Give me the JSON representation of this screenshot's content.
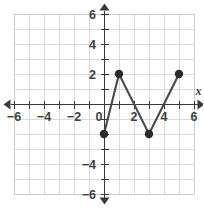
{
  "chart_data": {
    "type": "line",
    "title": "",
    "subtitle": "",
    "xlabel": "x",
    "ylabel": "",
    "xlim": [
      -6.6,
      6.6
    ],
    "ylim": [
      -6.6,
      6.6
    ],
    "grid": true,
    "grid_step": 1,
    "legend": "none",
    "x_tick_labels": [
      "-6",
      "-4",
      "-2",
      "0",
      "2",
      "4",
      "6"
    ],
    "x_tick_values": [
      -6,
      -4,
      -2,
      0,
      2,
      4,
      6
    ],
    "y_tick_labels": [
      "6",
      "4",
      "2",
      "-4",
      "-6"
    ],
    "y_tick_values": [
      6,
      4,
      2,
      -4,
      -6
    ],
    "origin_label": "0",
    "series": [
      {
        "name": "zigzag",
        "x": [
          0,
          1,
          3,
          5
        ],
        "y": [
          -2,
          2,
          -2,
          2
        ],
        "points": [
          {
            "x": 0,
            "y": -2
          },
          {
            "x": 1,
            "y": 2
          },
          {
            "x": 3,
            "y": -2
          },
          {
            "x": 5,
            "y": 2
          }
        ],
        "marker": "filled-circle",
        "line_color": "#4a4a4a",
        "marker_color": "#2b2b2b"
      }
    ],
    "colors": {
      "grid": "#d8dadd",
      "axis": "#3a3a3a",
      "line": "#4a4a4a",
      "marker": "#2b2b2b",
      "background": "#ffffff"
    }
  }
}
